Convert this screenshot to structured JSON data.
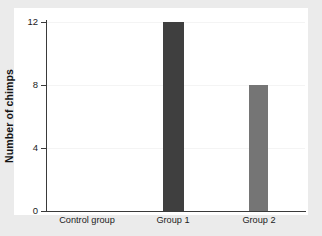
{
  "chart_data": {
    "type": "bar",
    "title": "",
    "xlabel": "",
    "ylabel": "Number of chimps",
    "categories": [
      "Control group",
      "Group 1",
      "Group 2"
    ],
    "values": [
      0,
      12,
      8
    ],
    "bar_colors": [
      "#3f3f3f",
      "#3f3f3f",
      "#757575"
    ],
    "ylim": [
      0,
      12
    ],
    "yticks": [
      0,
      4,
      8,
      12
    ],
    "ytick_labels": [
      "0",
      "4",
      "8",
      "12"
    ],
    "grid": true,
    "legend": null
  },
  "axis": {
    "y_title": "Number of chimps",
    "tick_0": "0",
    "tick_4": "4",
    "tick_8": "8",
    "tick_12": "12"
  },
  "categories": {
    "cat_0": "Control group",
    "cat_1": "Group 1",
    "cat_2": "Group 2"
  },
  "colors": {
    "figure_background": "#ebebeb",
    "plot_background": "#ffffff",
    "axis_line": "#3a3a3a",
    "gridline": "#f4f4f4",
    "bar_dark": "#3f3f3f",
    "bar_medium": "#757575",
    "text": "#1c1c1c"
  }
}
